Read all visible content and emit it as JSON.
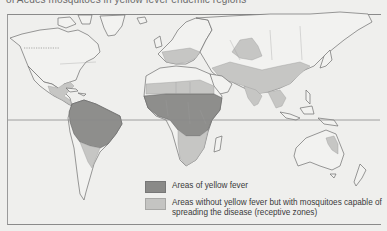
{
  "caption_cut": "of Aedes mosquitoes in yellow fever endemic regions",
  "map": {
    "title": "Yellow fever distribution world map",
    "colors": {
      "endemic": "#8e8e8c",
      "receptive": "#c6c6c4",
      "land": "#f2f2f0",
      "background": "#efefed"
    }
  },
  "legend": {
    "items": [
      {
        "key": "endemic",
        "label": "Areas of yellow fever"
      },
      {
        "key": "receptive",
        "label": "Areas without yellow fever but with mosquitoes capable of spreading the disease (receptive zones)"
      }
    ]
  }
}
